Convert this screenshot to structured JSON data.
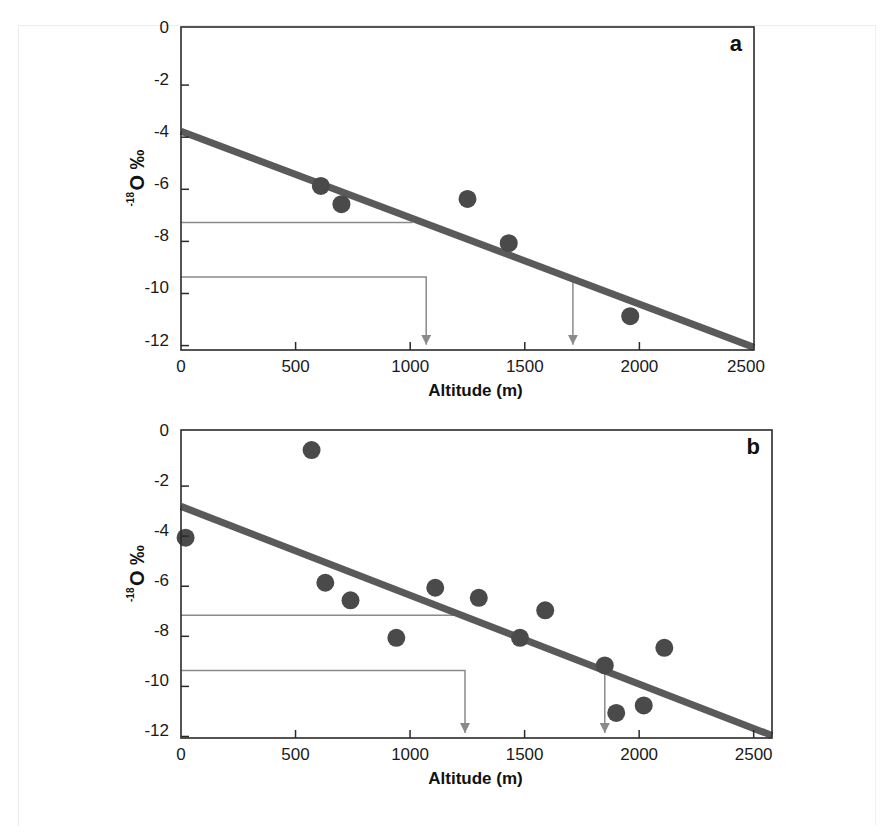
{
  "chart_data": [
    {
      "type": "scatter",
      "panel_label": "a",
      "title": "",
      "xlabel": "Altitude (m)",
      "ylabel": "-18O ‰",
      "ylabel_parts": {
        "sup": "-18",
        "main": "O ‰"
      },
      "xlim": [
        0,
        2500
      ],
      "ylim": [
        -12.4,
        0
      ],
      "xticks": [
        0,
        500,
        1000,
        1500,
        2000,
        2500
      ],
      "xtick_labels": [
        "0",
        "500",
        "1000",
        "1500",
        "2000",
        "2500"
      ],
      "yticks": [
        0,
        -2,
        -4,
        -6,
        -8,
        -10,
        -12
      ],
      "ytick_labels": [
        "0",
        "-2",
        "-4",
        "-6",
        "-8",
        "-10",
        "-12"
      ],
      "grid": false,
      "legend": null,
      "series": [
        {
          "name": "samples",
          "kind": "points",
          "color": "#4a4a4a",
          "points": [
            {
              "x": 610,
              "y": -6.1
            },
            {
              "x": 700,
              "y": -6.8
            },
            {
              "x": 1250,
              "y": -6.6
            },
            {
              "x": 1430,
              "y": -8.3
            },
            {
              "x": 1960,
              "y": -11.1
            }
          ]
        },
        {
          "name": "regression line",
          "kind": "line",
          "color": "#5a5a5a",
          "points": [
            {
              "x": 0,
              "y": -4.0
            },
            {
              "x": 2500,
              "y": -12.3
            }
          ]
        }
      ],
      "annotations": [
        {
          "kind": "guide",
          "description": "horizontal guide at -7.5 to regression line",
          "path": [
            [
              0,
              -7.5
            ],
            [
              1010,
              -7.5
            ]
          ],
          "arrow": false
        },
        {
          "kind": "guide",
          "description": "guide at -9.6 to 1070 m with down arrow",
          "path": [
            [
              0,
              -9.6
            ],
            [
              1070,
              -9.6
            ],
            [
              1070,
              -12.2
            ]
          ],
          "arrow": true
        },
        {
          "kind": "guide",
          "description": "down arrow from line at 1710 m",
          "path": [
            [
              1710,
              -9.7
            ],
            [
              1710,
              -12.2
            ]
          ],
          "arrow": true
        }
      ]
    },
    {
      "type": "scatter",
      "panel_label": "b",
      "title": "",
      "xlabel": "Altitude (m)",
      "ylabel": "-18O ‰",
      "ylabel_parts": {
        "sup": "-18",
        "main": "O ‰"
      },
      "xlim": [
        0,
        2580
      ],
      "ylim": [
        -12.3,
        0
      ],
      "xticks": [
        0,
        500,
        1000,
        1500,
        2000,
        2500
      ],
      "xtick_labels": [
        "0",
        "500",
        "1000",
        "1500",
        "2000",
        "2500"
      ],
      "yticks": [
        0,
        -2,
        -4,
        -6,
        -8,
        -10,
        -12
      ],
      "ytick_labels": [
        "0",
        "-2",
        "-4",
        "-6",
        "-8",
        "-10",
        "-12"
      ],
      "grid": false,
      "legend": null,
      "series": [
        {
          "name": "samples",
          "kind": "points",
          "color": "#4a4a4a",
          "points": [
            {
              "x": 20,
              "y": -4.3
            },
            {
              "x": 570,
              "y": -0.8
            },
            {
              "x": 630,
              "y": -6.1
            },
            {
              "x": 740,
              "y": -6.8
            },
            {
              "x": 940,
              "y": -8.3
            },
            {
              "x": 1110,
              "y": -6.3
            },
            {
              "x": 1300,
              "y": -6.7
            },
            {
              "x": 1480,
              "y": -8.3
            },
            {
              "x": 1590,
              "y": -7.2
            },
            {
              "x": 1850,
              "y": -9.4
            },
            {
              "x": 1900,
              "y": -11.3
            },
            {
              "x": 2020,
              "y": -11.0
            },
            {
              "x": 2110,
              "y": -8.7
            }
          ]
        },
        {
          "name": "regression line",
          "kind": "line",
          "color": "#5a5a5a",
          "points": [
            {
              "x": 0,
              "y": -3.05
            },
            {
              "x": 2580,
              "y": -12.2
            }
          ]
        }
      ],
      "annotations": [
        {
          "kind": "guide",
          "description": "horizontal guide at -7.4 to regression line",
          "path": [
            [
              0,
              -7.4
            ],
            [
              1230,
              -7.4
            ]
          ],
          "arrow": false
        },
        {
          "kind": "guide",
          "description": "guide at -9.6 to 1240 m with down arrow",
          "path": [
            [
              0,
              -9.6
            ],
            [
              1240,
              -9.6
            ],
            [
              1240,
              -12.1
            ]
          ],
          "arrow": true
        },
        {
          "kind": "guide",
          "description": "down arrow from line at 1850 m",
          "path": [
            [
              1850,
              -9.6
            ],
            [
              1850,
              -12.1
            ]
          ],
          "arrow": true
        }
      ]
    }
  ],
  "layout": {
    "panels": [
      {
        "left": 181,
        "right": 754,
        "top": 27,
        "bottom": 350
      },
      {
        "left": 181,
        "right": 772,
        "top": 430,
        "bottom": 738
      }
    ],
    "colors": {
      "axis": "#2a2a2a",
      "point": "#4a4a4a",
      "regression": "#5a5a5a",
      "guide": "#8a8a8a"
    }
  }
}
